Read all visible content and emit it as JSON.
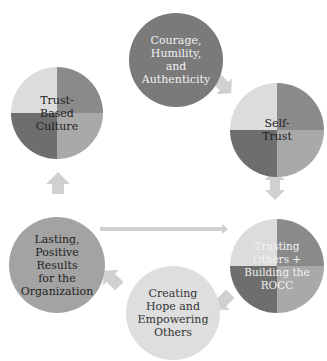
{
  "diagram": {
    "type": "cycle",
    "nodes": [
      {
        "id": "courage",
        "label": "Courage,\nHumility,\nand\nAuthenticity",
        "fill": "#7a7a7a",
        "text_color": "#f2f2f2"
      },
      {
        "id": "self_trust",
        "label": "Self-\nTrust",
        "quadrants": [
          "#dcdcdc",
          "#8a8a8a",
          "#6e6e6e",
          "#a9a9a9"
        ],
        "text_color": "#222222"
      },
      {
        "id": "trusting_others",
        "label": "Trusting\nOthers +\nBuilding the\nROCC",
        "quadrants": [
          "#dcdcdc",
          "#8a8a8a",
          "#6e6e6e",
          "#a9a9a9"
        ],
        "text_color": "#f2f2f2"
      },
      {
        "id": "creating_hope",
        "label": "Creating\nHope and\nEmpowering\nOthers",
        "fill": "#dedede",
        "text_color": "#333333"
      },
      {
        "id": "lasting_results",
        "label": "Lasting,\nPositive\nResults\nfor the\nOrganization",
        "fill": "#a3a3a3",
        "text_color": "#222222"
      },
      {
        "id": "trust_culture",
        "label": "Trust-\nBased\nCulture",
        "quadrants": [
          "#dcdcdc",
          "#8a8a8a",
          "#6e6e6e",
          "#a9a9a9"
        ],
        "text_color": "#222222"
      }
    ],
    "edges": [
      {
        "from": "courage",
        "to": "self_trust",
        "style": "block-arrow"
      },
      {
        "from": "self_trust",
        "to": "trusting_others",
        "style": "double-arrow"
      },
      {
        "from": "trusting_others",
        "to": "creating_hope",
        "style": "block-arrow"
      },
      {
        "from": "creating_hope",
        "to": "lasting_results",
        "style": "block-arrow"
      },
      {
        "from": "lasting_results",
        "to": "trusting_others",
        "style": "long-arrow"
      },
      {
        "from": "lasting_results",
        "to": "trust_culture",
        "style": "block-arrow"
      }
    ],
    "arrow_color": "#d0d0d0"
  }
}
